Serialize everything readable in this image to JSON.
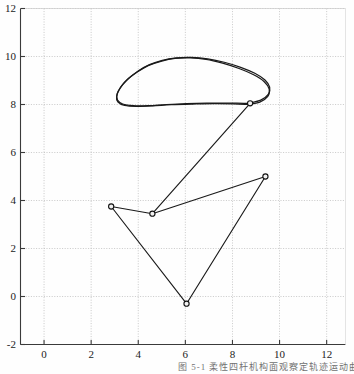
{
  "figure": {
    "caption": "图 5-1  柔性四杆机构面观察定轨迹运动曲线",
    "background_color": "#fefefe",
    "axis_color": "#3a3a3a",
    "grid_color": "#b9b9b9",
    "curve_color": "#1a1a1a",
    "marker_fill": "#f2f2f2",
    "marker_edge": "#111111"
  },
  "axes": {
    "x": {
      "label": "",
      "min": -1.0,
      "max": 12.8,
      "ticks": [
        0,
        2,
        4,
        6,
        8,
        10,
        12
      ],
      "tick_labels": [
        "0",
        "2",
        "4",
        "6",
        "8",
        "10",
        "12"
      ],
      "grid": true
    },
    "y": {
      "label": "",
      "min": -2.0,
      "max": 12.0,
      "ticks": [
        -2,
        0,
        2,
        4,
        6,
        8,
        10,
        12
      ],
      "tick_labels": [
        "-2",
        "0",
        "2",
        "4",
        "6",
        "8",
        "10",
        "12"
      ],
      "grid": true
    }
  },
  "chart_data": {
    "type": "line",
    "title": "",
    "xlabel": "",
    "ylabel": "",
    "xlim": [
      -1.0,
      12.8
    ],
    "ylim": [
      -2.0,
      12.0
    ],
    "grid": true,
    "legend": null,
    "series": [
      {
        "name": "coupler-loop",
        "style": "closed-loop",
        "comment": "upper closed loop traced twice with slight offset",
        "points": [
          [
            8.72,
            8.06
          ],
          [
            9.2,
            8.18
          ],
          [
            9.52,
            8.42
          ],
          [
            9.58,
            8.72
          ],
          [
            9.38,
            9.02
          ],
          [
            8.95,
            9.3
          ],
          [
            8.35,
            9.55
          ],
          [
            7.65,
            9.76
          ],
          [
            6.95,
            9.9
          ],
          [
            6.25,
            9.96
          ],
          [
            5.62,
            9.94
          ],
          [
            5.02,
            9.84
          ],
          [
            4.48,
            9.66
          ],
          [
            4.0,
            9.4
          ],
          [
            3.58,
            9.08
          ],
          [
            3.26,
            8.74
          ],
          [
            3.1,
            8.42
          ],
          [
            3.12,
            8.18
          ],
          [
            3.34,
            8.02
          ],
          [
            3.78,
            7.95
          ],
          [
            4.42,
            7.95
          ],
          [
            5.2,
            8.0
          ],
          [
            6.05,
            8.04
          ],
          [
            6.92,
            8.06
          ],
          [
            7.78,
            8.06
          ],
          [
            8.48,
            8.05
          ],
          [
            8.72,
            8.06
          ]
        ]
      },
      {
        "name": "coupler-loop-second-pass",
        "style": "closed-loop",
        "comment": "second slightly shifted revolution of the same loop",
        "points": [
          [
            8.64,
            8.0
          ],
          [
            9.16,
            8.1
          ],
          [
            9.5,
            8.34
          ],
          [
            9.56,
            8.64
          ],
          [
            9.34,
            8.96
          ],
          [
            8.9,
            9.24
          ],
          [
            8.28,
            9.5
          ],
          [
            7.58,
            9.72
          ],
          [
            6.88,
            9.88
          ],
          [
            6.2,
            9.94
          ],
          [
            5.56,
            9.92
          ],
          [
            4.96,
            9.8
          ],
          [
            4.42,
            9.62
          ],
          [
            3.94,
            9.34
          ],
          [
            3.52,
            9.02
          ],
          [
            3.22,
            8.66
          ],
          [
            3.08,
            8.34
          ],
          [
            3.14,
            8.1
          ],
          [
            3.42,
            7.96
          ],
          [
            3.92,
            7.92
          ],
          [
            4.6,
            7.94
          ],
          [
            5.4,
            7.99
          ],
          [
            6.3,
            8.02
          ],
          [
            7.2,
            8.04
          ],
          [
            8.05,
            8.03
          ],
          [
            8.64,
            8.0
          ]
        ]
      },
      {
        "name": "connecting-polyline",
        "style": "polyline-with-markers",
        "points": [
          [
            8.75,
            8.05
          ],
          [
            4.6,
            3.45
          ],
          [
            2.85,
            3.75
          ],
          [
            6.05,
            -0.3
          ],
          [
            9.4,
            5.0
          ],
          [
            4.6,
            3.45
          ]
        ]
      }
    ],
    "markers": [
      {
        "x": 8.75,
        "y": 8.05
      },
      {
        "x": 4.6,
        "y": 3.45
      },
      {
        "x": 2.85,
        "y": 3.75
      },
      {
        "x": 6.05,
        "y": -0.3
      },
      {
        "x": 9.4,
        "y": 5.0
      }
    ]
  }
}
